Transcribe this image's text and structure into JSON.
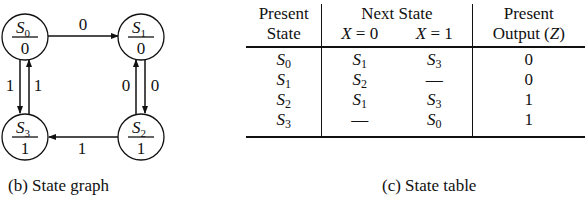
{
  "state_graph": {
    "caption": "(b) State graph",
    "states": [
      {
        "id": "S0",
        "name": "S",
        "sub": "0",
        "output": "0"
      },
      {
        "id": "S1",
        "name": "S",
        "sub": "1",
        "output": "0"
      },
      {
        "id": "S2",
        "name": "S",
        "sub": "2",
        "output": "1"
      },
      {
        "id": "S3",
        "name": "S",
        "sub": "3",
        "output": "1"
      }
    ],
    "transitions": [
      {
        "from": "S0",
        "to": "S1",
        "label": "0"
      },
      {
        "from": "S1",
        "to": "S2",
        "label": "0"
      },
      {
        "from": "S2",
        "to": "S1",
        "label": "0"
      },
      {
        "from": "S2",
        "to": "S3",
        "label": "1"
      },
      {
        "from": "S0",
        "to": "S3",
        "label": "1"
      },
      {
        "from": "S3",
        "to": "S0",
        "label": "1"
      }
    ]
  },
  "state_table": {
    "caption": "(c) State table",
    "headers": {
      "present_state_1": "Present",
      "present_state_2": "State",
      "next_state": "Next State",
      "x0_var": "X",
      "x0_eq": " = 0",
      "x1_var": "X",
      "x1_eq": " = 1",
      "output_1": "Present",
      "output_2a": "Output (",
      "output_var": "Z",
      "output_2b": ")"
    },
    "rows": [
      {
        "present": {
          "n": "S",
          "s": "0"
        },
        "x0": {
          "n": "S",
          "s": "1"
        },
        "x1": {
          "n": "S",
          "s": "3"
        },
        "z": "0"
      },
      {
        "present": {
          "n": "S",
          "s": "1"
        },
        "x0": {
          "n": "S",
          "s": "2"
        },
        "x1": {
          "n": "—",
          "s": ""
        },
        "z": "0"
      },
      {
        "present": {
          "n": "S",
          "s": "2"
        },
        "x0": {
          "n": "S",
          "s": "1"
        },
        "x1": {
          "n": "S",
          "s": "3"
        },
        "z": "1"
      },
      {
        "present": {
          "n": "S",
          "s": "3"
        },
        "x0": {
          "n": "—",
          "s": ""
        },
        "x1": {
          "n": "S",
          "s": "0"
        },
        "z": "1"
      }
    ]
  }
}
